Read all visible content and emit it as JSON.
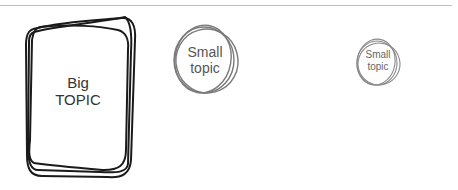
{
  "diagram": {
    "nodes": [
      {
        "id": "big",
        "line1": "Big",
        "line2": "TOPIC",
        "shape": "scribbled-rounded-rectangle",
        "stroke": "#1a1a1a"
      },
      {
        "id": "medium",
        "line1": "Small",
        "line2": "topic",
        "shape": "scribbled-circle",
        "stroke": "#7a7a7a"
      },
      {
        "id": "small",
        "line1": "Small",
        "line2": "topic",
        "shape": "scribbled-circle",
        "stroke": "#8a8a8a"
      }
    ]
  }
}
